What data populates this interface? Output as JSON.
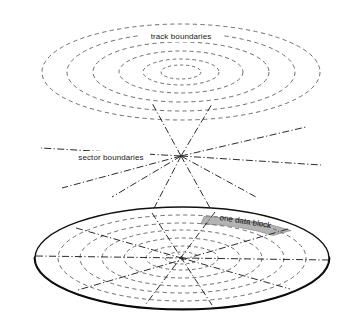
{
  "figure": {
    "title_visible": false,
    "background_color": "#ffffff",
    "labels": {
      "track_boundaries": "track boundaries",
      "sector_boundaries": "sector boundaries",
      "one_data_block": "one data block"
    },
    "colors": {
      "dashed_track_line": "#6e6e6e",
      "dashdot_sector_line": "#2b2b2b",
      "platter_outline": "#111111",
      "platter_edge_shadow": "#000000",
      "data_block_fill": "#b3b3b3",
      "text": "#1a1a1a"
    },
    "planes": {
      "track_plane": {
        "name": "track-boundaries-plane",
        "center_x": 181,
        "center_y": 72,
        "ring_count": 6,
        "rings_rx": [
          139,
          114,
          88,
          62,
          38,
          20
        ],
        "rings_ry": [
          48,
          39,
          30,
          21,
          13,
          7
        ],
        "line_style": "dashed"
      },
      "sector_plane": {
        "name": "sector-boundaries-plane",
        "converge_x": 181,
        "converge_y": 156,
        "line_count": 8,
        "line_style": "dash-dot",
        "ray_endpoints": [
          {
            "x": 41,
            "y": 148
          },
          {
            "x": 321,
            "y": 165
          },
          {
            "x": 62,
            "y": 188
          },
          {
            "x": 306,
            "y": 127
          },
          {
            "x": 112,
            "y": 197
          },
          {
            "x": 256,
            "y": 197
          },
          {
            "x": 152,
            "y": 103
          },
          {
            "x": 212,
            "y": 200
          }
        ]
      },
      "platter_plane": {
        "name": "disk-platter",
        "center_x": 182,
        "center_y": 258,
        "outer_rx": 147,
        "outer_ry": 51,
        "ring_count": 6,
        "rings_rx": [
          124,
          102,
          80,
          58,
          36,
          17
        ],
        "rings_ry": [
          43,
          35,
          28,
          20,
          12,
          6
        ],
        "sector_line_count": 8,
        "edge_thickness_px": 2.6
      }
    },
    "data_block": {
      "name": "one-data-block-wedge",
      "fill": "#b3b3b3",
      "sector_index": 1,
      "ring_band": "outer"
    }
  }
}
